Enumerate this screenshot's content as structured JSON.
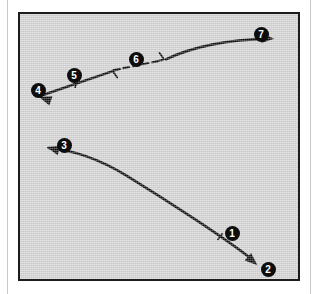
{
  "figure": {
    "background_color": "#ffffff",
    "plate_color": "#d3d3d3",
    "ink_color": "#0d0d0d",
    "label_text_color": "#ffffff",
    "frame": {
      "x": 18,
      "y": 12,
      "width": 282,
      "height": 269,
      "border_width": 2
    },
    "page_rules": [
      {
        "name": "left-margin-rule",
        "x": 7
      },
      {
        "name": "right-margin-rule",
        "x": 310
      }
    ]
  },
  "markers": [
    {
      "id": "1",
      "label": "1",
      "x": 230,
      "y": 231
    },
    {
      "id": "2",
      "label": "2",
      "x": 266,
      "y": 267
    },
    {
      "id": "3",
      "label": "3",
      "x": 62,
      "y": 143
    },
    {
      "id": "4",
      "label": "4",
      "x": 36,
      "y": 88
    },
    {
      "id": "5",
      "label": "5",
      "x": 72,
      "y": 73
    },
    {
      "id": "6",
      "label": "6",
      "x": 134,
      "y": 57
    },
    {
      "id": "7",
      "label": "7",
      "x": 259,
      "y": 32
    }
  ],
  "paths": [
    {
      "name": "lower-trace",
      "style": "solid",
      "stroke_width": 2.6,
      "d": "M 252 260 C 228 241, 170 203, 126 176 C 98 159, 70 150, 47 148",
      "arrow_start": {
        "x": 259,
        "y": 267,
        "angle_deg": 41
      },
      "arrow_end": {
        "x": 45,
        "y": 147,
        "angle_deg": 196
      },
      "ticks": [
        {
          "x": 221,
          "y": 238,
          "angle_deg": 38
        }
      ]
    },
    {
      "name": "upper-left-trace",
      "style": "solid",
      "stroke_width": 2.6,
      "d": "M 112 70 L 42 94",
      "arrow_start": null,
      "arrow_end": {
        "x": 37,
        "y": 96,
        "angle_deg": 199
      },
      "ticks": [
        {
          "x": 75,
          "y": 83,
          "angle_deg": 199
        }
      ]
    },
    {
      "name": "upper-center-dashed-trace",
      "style": "dashed",
      "dash_pattern": "6 4",
      "stroke_width": 2.2,
      "d": "M 113 69 L 162 59",
      "arrow_start": null,
      "arrow_end": null,
      "ticks": []
    },
    {
      "name": "upper-right-trace",
      "style": "solid",
      "stroke_width": 2.6,
      "d": "M 166 58 C 196 44, 230 38, 270 37",
      "arrow_start": null,
      "arrow_end": {
        "x": 276,
        "y": 37,
        "angle_deg": 2
      },
      "ticks": []
    }
  ],
  "barbs": [
    {
      "name": "barb-left-of-dashed",
      "x": 112,
      "y": 70,
      "angle_deg": 19
    },
    {
      "name": "barb-right-of-dashed",
      "x": 164,
      "y": 58,
      "angle_deg": 200
    }
  ]
}
